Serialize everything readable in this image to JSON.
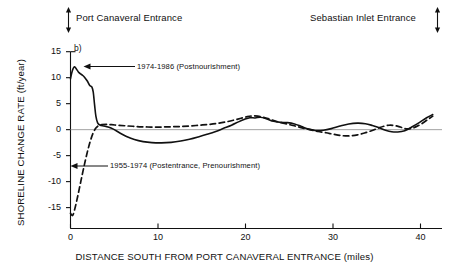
{
  "figure": {
    "panel_tag": "b)",
    "top_annotations": [
      {
        "name": "port-canaveral-entrance",
        "text": "Port Canaveral Entrance",
        "marker": "double-headed-vertical-arrow",
        "marker_side": "left"
      },
      {
        "name": "sebastian-inlet-entrance",
        "text": "Sebastian Inlet Entrance",
        "marker": "double-headed-vertical-arrow",
        "marker_side": "right"
      }
    ]
  },
  "chart_data": {
    "type": "line",
    "title": "",
    "xlabel": "DISTANCE SOUTH FROM PORT CANAVERAL ENTRANCE (miles)",
    "ylabel": "SHORELINE CHANGE RATE (ft/year)",
    "xlim": [
      0,
      42
    ],
    "ylim": [
      -17,
      16
    ],
    "xticks": [
      0,
      10,
      20,
      30,
      40
    ],
    "xticklabels": [
      "0",
      "10",
      "20",
      "30",
      "40"
    ],
    "yticks": [
      15,
      10,
      5,
      0,
      -5,
      -10,
      -15
    ],
    "yticklabels": [
      "15",
      "10",
      "5",
      "0",
      "-5",
      "-10",
      "-15"
    ],
    "grid": false,
    "zero_line": true,
    "legend_position": "inline-annotations",
    "series": [
      {
        "name": "1974-1986 (Postnourishment)",
        "label": "1974-1986 (Postnourishment)",
        "style": "solid",
        "color": "#111111",
        "x": [
          0.0,
          0.2,
          0.45,
          0.7,
          0.9,
          1.1,
          1.35,
          1.6,
          1.9,
          2.2,
          2.45,
          2.6,
          2.75,
          2.9,
          3.1,
          3.4,
          3.8,
          4.3,
          4.9,
          5.6,
          6.4,
          7.3,
          8.3,
          9.3,
          10.4,
          11.5,
          12.6,
          13.6,
          14.6,
          15.6,
          16.6,
          17.5,
          18.4,
          19.2,
          19.9,
          20.5,
          21.1,
          21.7,
          22.4,
          23.2,
          24.0,
          24.8,
          25.6,
          26.4,
          27.2,
          28.0,
          28.9,
          29.8,
          30.8,
          31.8,
          32.8,
          33.7,
          34.5,
          35.3,
          36.0,
          36.7,
          37.4,
          38.2,
          39.0,
          39.9,
          40.7,
          41.4
        ],
        "y": [
          9.8,
          11.3,
          12.1,
          11.6,
          11.1,
          10.8,
          10.5,
          10.1,
          9.4,
          8.5,
          8.2,
          7.2,
          4.8,
          2.6,
          1.3,
          0.85,
          0.7,
          0.5,
          0.1,
          -0.6,
          -1.3,
          -1.9,
          -2.3,
          -2.5,
          -2.55,
          -2.45,
          -2.2,
          -1.85,
          -1.4,
          -0.9,
          -0.35,
          0.25,
          0.85,
          1.5,
          2.0,
          2.3,
          2.25,
          2.4,
          2.1,
          1.6,
          1.4,
          1.35,
          1.1,
          0.6,
          0.1,
          -0.15,
          -0.1,
          0.2,
          0.7,
          1.1,
          1.25,
          1.15,
          0.8,
          0.35,
          -0.1,
          -0.4,
          -0.45,
          -0.2,
          0.5,
          1.4,
          2.3,
          2.9
        ]
      },
      {
        "name": "1955-1974 (Postentrance, Prenourishment)",
        "label": "1955-1974 (Postentrance, Prenourishment)",
        "style": "dashed",
        "color": "#111111",
        "x": [
          0.0,
          0.25,
          0.5,
          0.8,
          1.1,
          1.4,
          1.7,
          2.0,
          2.3,
          2.6,
          2.9,
          3.2,
          3.6,
          4.1,
          4.7,
          5.4,
          6.2,
          7.1,
          8.1,
          9.2,
          10.3,
          11.4,
          12.5,
          13.6,
          14.7,
          15.8,
          16.8,
          17.8,
          18.7,
          19.5,
          20.2,
          20.8,
          21.4,
          22.0,
          22.7,
          23.5,
          24.3,
          25.1,
          25.9,
          26.7,
          27.5,
          28.3,
          29.2,
          30.1,
          31.0,
          31.9,
          32.8,
          33.6,
          34.4,
          35.1,
          35.8,
          36.4,
          37.0,
          37.7,
          38.4,
          39.2,
          40.0,
          40.8,
          41.4
        ],
        "y": [
          -16.1,
          -16.5,
          -15.2,
          -13.0,
          -10.6,
          -8.2,
          -5.9,
          -3.8,
          -2.0,
          -0.6,
          0.3,
          0.75,
          0.95,
          1.0,
          0.95,
          0.85,
          0.75,
          0.65,
          0.55,
          0.5,
          0.5,
          0.55,
          0.6,
          0.7,
          0.85,
          1.0,
          1.2,
          1.5,
          1.85,
          2.2,
          2.5,
          2.65,
          2.6,
          2.4,
          2.05,
          1.6,
          1.25,
          0.95,
          0.6,
          0.25,
          -0.05,
          -0.35,
          -0.6,
          -0.9,
          -1.15,
          -1.2,
          -1.0,
          -0.65,
          -0.2,
          0.25,
          0.65,
          0.85,
          0.8,
          0.5,
          0.15,
          0.35,
          1.0,
          1.9,
          2.6
        ]
      }
    ]
  }
}
